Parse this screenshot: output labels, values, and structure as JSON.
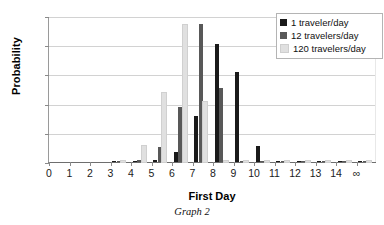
{
  "chart_data": {
    "type": "bar",
    "title": "",
    "caption": "Graph 2",
    "xlabel": "First Day",
    "ylabel": "Probability",
    "categories": [
      "0",
      "1",
      "2",
      "3",
      "4",
      "5",
      "6",
      "7",
      "8",
      "9",
      "10",
      "11",
      "12",
      "13",
      "14",
      "∞"
    ],
    "ylim": [
      0,
      0.5
    ],
    "yticks": [
      "0",
      "0.1",
      "0.2",
      "0.3",
      "0.4",
      "0.5"
    ],
    "ytick_values": [
      0,
      0.1,
      0.2,
      0.3,
      0.4,
      0.5
    ],
    "grid": true,
    "legend_position": "top-right",
    "series": [
      {
        "name": "1 traveler/day",
        "color": "#1a1a1a",
        "values": [
          0,
          0,
          0,
          0.002,
          0.004,
          0.008,
          0.035,
          0.158,
          0.403,
          0.308,
          0.054,
          0.002,
          0.001,
          0.001,
          0.001,
          0.003
        ]
      },
      {
        "name": "12 travelers/day",
        "color": "#585858",
        "values": [
          0,
          0,
          0,
          0.004,
          0.007,
          0.05,
          0.187,
          0.472,
          0.253,
          0.003,
          0.001,
          0.001,
          0.001,
          0.001,
          0.001,
          0.002
        ]
      },
      {
        "name": "120 travelers/day",
        "color": "#e0e0e0",
        "values": [
          0,
          0,
          0,
          0.003,
          0.056,
          0.237,
          0.47,
          0.207,
          0.002,
          0.001,
          0.001,
          0.001,
          0.001,
          0.001,
          0.001,
          0.002
        ]
      }
    ]
  },
  "legend": {
    "items": [
      {
        "label": "1 traveler/day",
        "color": "#1a1a1a"
      },
      {
        "label": "12 travelers/day",
        "color": "#585858"
      },
      {
        "label": "120 travelers/day",
        "color": "#e0e0e0"
      }
    ]
  }
}
